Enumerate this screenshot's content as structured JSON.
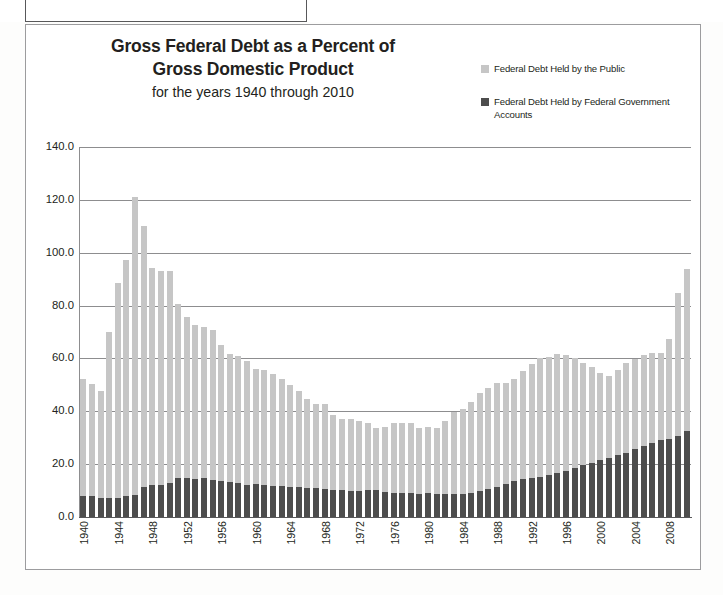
{
  "page": {
    "background_color": "#fdfdfc",
    "card_border_color": "#9c9c9e"
  },
  "title": {
    "line1": "Gross Federal Debt as a Percent of",
    "line2": "Gross Domestic Product",
    "subtitle": "for the years 1940 through 2010"
  },
  "legend": {
    "items": [
      {
        "label": "Federal Debt Held by the Public",
        "color": "#c6c6c6"
      },
      {
        "label": "Federal Debt Held by Federal Government Accounts",
        "color": "#4d4d4d"
      }
    ]
  },
  "chart_data": {
    "type": "bar",
    "stacked": true,
    "title": "Gross Federal Debt as a Percent of Gross Domestic Product",
    "subtitle": "for the years 1940 through 2010",
    "xlabel": "",
    "ylabel": "",
    "ylim": [
      0.0,
      140.0
    ],
    "yticks": [
      "0.0",
      "20.0",
      "40.0",
      "60.0",
      "80.0",
      "100.0",
      "120.0",
      "140.0"
    ],
    "ytick_values": [
      0.0,
      20.0,
      40.0,
      60.0,
      80.0,
      100.0,
      120.0,
      140.0
    ],
    "grid": true,
    "grid_axis": "y",
    "legend_position": "top-right",
    "xtick_labels": [
      "1940",
      "1944",
      "1948",
      "1952",
      "1956",
      "1960",
      "1964",
      "1968",
      "1972",
      "1976",
      "1980",
      "1984",
      "1988",
      "1992",
      "1996",
      "2000",
      "2004",
      "2008"
    ],
    "xtick_interval": 4,
    "categories": [
      1940,
      1941,
      1942,
      1943,
      1944,
      1945,
      1946,
      1947,
      1948,
      1949,
      1950,
      1951,
      1952,
      1953,
      1954,
      1955,
      1956,
      1957,
      1958,
      1959,
      1960,
      1961,
      1962,
      1963,
      1964,
      1965,
      1966,
      1967,
      1968,
      1969,
      1970,
      1971,
      1972,
      1973,
      1974,
      1975,
      1976,
      1977,
      1978,
      1979,
      1980,
      1981,
      1982,
      1983,
      1984,
      1985,
      1986,
      1987,
      1988,
      1989,
      1990,
      1991,
      1992,
      1993,
      1994,
      1995,
      1996,
      1997,
      1998,
      1999,
      2000,
      2001,
      2002,
      2003,
      2004,
      2005,
      2006,
      2007,
      2008,
      2009,
      2010
    ],
    "series": [
      {
        "name": "Federal Debt Held by Federal Government Accounts",
        "color": "#4d4d4d",
        "values": [
          8.1,
          7.9,
          7.3,
          7.2,
          7.1,
          8.0,
          8.5,
          11.3,
          12.0,
          12.2,
          13.0,
          14.6,
          14.6,
          14.5,
          14.8,
          13.9,
          13.5,
          13.4,
          12.9,
          12.2,
          12.4,
          12.2,
          11.9,
          11.9,
          11.5,
          11.2,
          11.0,
          10.8,
          10.5,
          10.4,
          10.1,
          10.0,
          10.0,
          10.2,
          10.3,
          9.5,
          9.0,
          8.9,
          8.9,
          8.8,
          8.9,
          8.8,
          8.7,
          8.7,
          8.6,
          9.0,
          9.8,
          10.6,
          11.4,
          12.4,
          13.5,
          14.2,
          14.7,
          15.2,
          15.9,
          16.8,
          17.6,
          18.4,
          19.6,
          20.5,
          21.5,
          22.4,
          23.3,
          24.4,
          25.6,
          26.9,
          28.1,
          29.0,
          29.4,
          30.6,
          32.7
        ]
      },
      {
        "name": "Federal Debt Held by the Public",
        "color": "#c6c6c6",
        "values": [
          44.2,
          42.4,
          40.4,
          62.7,
          81.5,
          89.1,
          112.7,
          98.9,
          82.4,
          81.0,
          80.2,
          66.0,
          61.1,
          58.1,
          57.1,
          56.8,
          51.5,
          48.4,
          47.9,
          46.8,
          43.6,
          43.5,
          42.3,
          40.2,
          38.3,
          36.6,
          33.7,
          31.9,
          32.3,
          28.1,
          27.0,
          27.1,
          26.5,
          25.2,
          23.3,
          24.5,
          26.7,
          26.7,
          26.6,
          24.9,
          25.2,
          24.8,
          27.5,
          31.2,
          32.2,
          34.6,
          37.0,
          38.4,
          39.3,
          38.3,
          38.8,
          41.0,
          43.3,
          44.9,
          44.8,
          44.7,
          43.8,
          41.8,
          38.6,
          36.1,
          33.1,
          31.0,
          32.5,
          33.7,
          34.2,
          34.4,
          34.1,
          33.0,
          38.0,
          54.2,
          61.0
        ]
      }
    ],
    "totals": [
      52.3,
      50.3,
      47.7,
      69.9,
      88.6,
      97.1,
      121.2,
      110.2,
      94.4,
      93.2,
      93.2,
      80.6,
      75.7,
      72.6,
      71.9,
      70.7,
      65.0,
      61.8,
      60.8,
      59.0,
      56.0,
      55.7,
      54.2,
      52.1,
      49.8,
      47.8,
      44.7,
      42.7,
      42.8,
      38.5,
      37.1,
      37.1,
      36.5,
      35.4,
      33.6,
      34.0,
      35.7,
      35.6,
      35.5,
      33.7,
      34.1,
      33.6,
      36.2,
      39.9,
      40.8,
      43.6,
      46.8,
      49.0,
      50.7,
      50.7,
      52.3,
      55.2,
      58.0,
      60.1,
      60.7,
      61.5,
      61.4,
      60.2,
      58.2,
      56.6,
      54.6,
      53.4,
      55.8,
      58.1,
      59.8,
      61.3,
      62.2,
      62.0,
      67.4,
      84.8,
      93.7
    ]
  }
}
